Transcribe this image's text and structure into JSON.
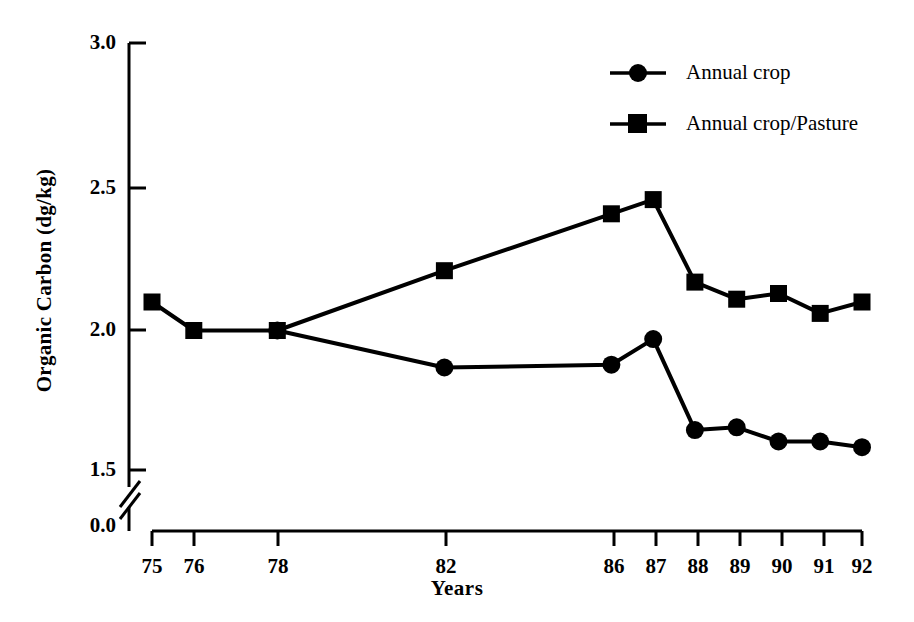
{
  "chart_data": {
    "type": "line",
    "title": "",
    "xlabel": "Years",
    "ylabel": "Organic Carbon (dg/kg)",
    "x": [
      75,
      76,
      78,
      82,
      86,
      87,
      88,
      89,
      90,
      91,
      92
    ],
    "xtick_labels": [
      "75",
      "76",
      "78",
      "82",
      "86",
      "87",
      "88",
      "89",
      "90",
      "91",
      "92"
    ],
    "ytick_labels": [
      "0.0",
      "1.5",
      "2.0",
      "2.5",
      "3.0"
    ],
    "ytick_values": [
      0.0,
      1.5,
      2.0,
      2.5,
      3.0
    ],
    "ylim": [
      1.42,
      3.0
    ],
    "xlim": [
      74.5,
      92.5
    ],
    "axis_break": true,
    "axis_break_note": "y-axis broken between 0.0 and 1.5",
    "grid": false,
    "legend_position": "top-right",
    "series": [
      {
        "name": "Annual crop",
        "marker": "circle",
        "x": [
          78,
          82,
          86,
          87,
          88,
          89,
          90,
          91,
          92
        ],
        "values": [
          1.99,
          1.86,
          1.87,
          1.96,
          1.64,
          1.65,
          1.6,
          1.6,
          1.58
        ]
      },
      {
        "name": "Annual crop/Pasture",
        "marker": "square",
        "x": [
          75,
          76,
          78,
          82,
          86,
          87,
          88,
          89,
          90,
          91,
          92
        ],
        "values": [
          2.09,
          1.99,
          1.99,
          2.2,
          2.4,
          2.45,
          2.16,
          2.1,
          2.12,
          2.05,
          2.09
        ]
      }
    ]
  },
  "axes": {
    "y_title": "Organic Carbon (dg/kg)",
    "x_title": "Years",
    "yticks": [
      {
        "label": "3.0"
      },
      {
        "label": "2.5"
      },
      {
        "label": "2.0"
      },
      {
        "label": "1.5"
      },
      {
        "label": "0.0"
      }
    ],
    "xticks": [
      {
        "label": "75"
      },
      {
        "label": "76"
      },
      {
        "label": "78"
      },
      {
        "label": "82"
      },
      {
        "label": "86"
      },
      {
        "label": "87"
      },
      {
        "label": "88"
      },
      {
        "label": "89"
      },
      {
        "label": "90"
      },
      {
        "label": "91"
      },
      {
        "label": "92"
      }
    ]
  },
  "legend": {
    "entries": [
      {
        "label": "Annual crop",
        "marker": "circle"
      },
      {
        "label": "Annual crop/Pasture",
        "marker": "square"
      }
    ]
  },
  "colors": {
    "ink": "#000000",
    "background": "#ffffff"
  }
}
